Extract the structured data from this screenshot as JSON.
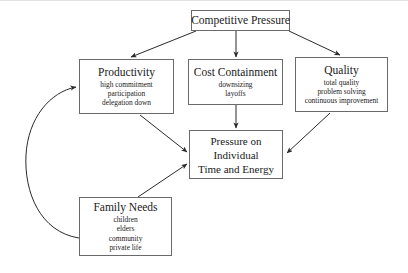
{
  "diagram": {
    "nodes": {
      "competitive_pressure": {
        "title": "Competitive Pressure",
        "sub": []
      },
      "productivity": {
        "title": "Productivity",
        "sub": [
          "high commitment",
          "participation",
          "delegation down"
        ]
      },
      "cost_containment": {
        "title": "Cost Containment",
        "sub": [
          "downsizing",
          "layoffs"
        ]
      },
      "quality": {
        "title": "Quality",
        "sub": [
          "total quality",
          "problem solving",
          "continuous improvement"
        ]
      },
      "pressure_individual": {
        "title_line1": "Pressure on",
        "title_line2": "Individual",
        "title_line3": "Time and Energy"
      },
      "family_needs": {
        "title": "Family Needs",
        "sub": [
          "children",
          "elders",
          "community",
          "private life"
        ]
      }
    },
    "colors": {
      "box_border": "#6a6a6a",
      "arrow": "#2a2a2a",
      "background": "#ffffff",
      "text": "#1a1a1a"
    }
  }
}
